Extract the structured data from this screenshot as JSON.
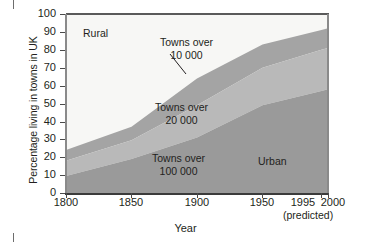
{
  "chart_data": {
    "type": "area",
    "title": "",
    "xlabel": "Year",
    "ylabel": "Percentage living in towns in UK",
    "xlim": [
      1800,
      2000
    ],
    "ylim": [
      0,
      100
    ],
    "grid": false,
    "legend_position": "inline-annotations",
    "x": [
      1800,
      1850,
      1900,
      1950,
      1995,
      2000
    ],
    "xtick_labels": [
      "1800",
      "1850",
      "1900",
      "1950",
      "1995",
      "2000"
    ],
    "ytick_labels": [
      "0",
      "10",
      "20",
      "30",
      "40",
      "50",
      "60",
      "70",
      "80",
      "90",
      "100"
    ],
    "note": "(predicted)",
    "stacking": "cumulative-top-edges",
    "series": [
      {
        "name": "Towns over 100 000",
        "alt_name": "Urban",
        "color": "#9a9a9a",
        "cumulative_top": [
          9.5,
          19,
          31,
          49,
          57,
          58
        ]
      },
      {
        "name": "Towns over 20 000",
        "color": "#b9b9b9",
        "cumulative_top": [
          18,
          29.5,
          49,
          70,
          80,
          81
        ]
      },
      {
        "name": "Towns over 10 000",
        "color": "#a4a4a4",
        "cumulative_top": [
          24,
          37,
          64,
          83,
          91,
          92
        ]
      },
      {
        "name": "Rural",
        "color": "#f7f7f5",
        "cumulative_top": [
          100,
          100,
          100,
          100,
          100,
          100
        ]
      }
    ]
  },
  "axes": {
    "y_title": "Percentage living in towns in UK",
    "x_title": "Year",
    "y_ticks": [
      "100",
      "90",
      "80",
      "70",
      "60",
      "50",
      "40",
      "30",
      "20",
      "10",
      "0"
    ],
    "x_ticks": [
      "1800",
      "1850",
      "1900",
      "1950",
      "1995",
      "2000"
    ],
    "predicted_note": "(predicted)"
  },
  "annotations": {
    "rural": "Rural",
    "towns10_line1": "Towns over",
    "towns10_line2": "10 000",
    "towns20_line1": "Towns over",
    "towns20_line2": "20 000",
    "towns100_line1": "Towns over",
    "towns100_line2": "100 000",
    "urban": "Urban"
  },
  "colors": {
    "rural": "#f7f7f5",
    "towns_over_10000": "#a4a4a4",
    "towns_over_20000": "#b9b9b9",
    "towns_over_100000": "#9a9a9a",
    "axis": "#3b3b3b",
    "text": "#231f20"
  }
}
